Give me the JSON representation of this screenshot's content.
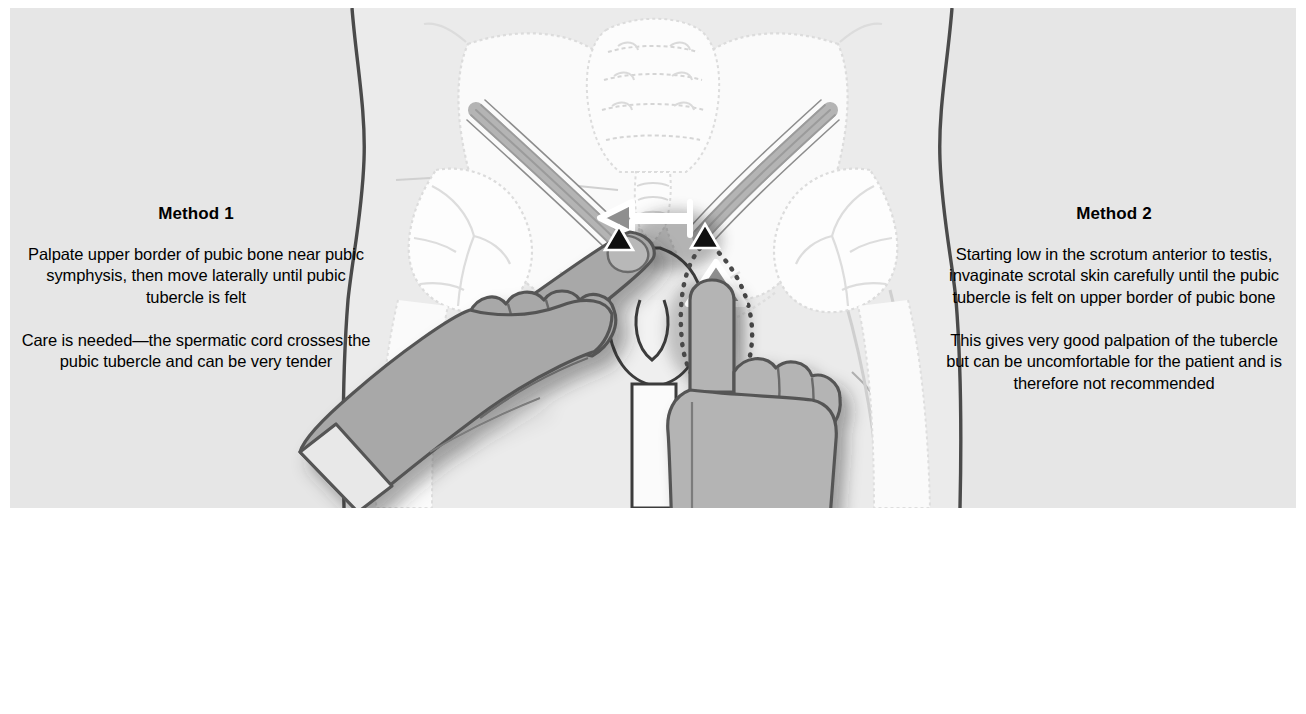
{
  "figure": {
    "type": "medical-illustration",
    "background_color": "#e6e6e6",
    "page_color": "#ffffff"
  },
  "panels": {
    "left": {
      "title": "Method 1",
      "paragraphs": [
        "Palpate upper border of pubic bone near pubic symphysis, then move laterally until pubic tubercle is felt",
        "Care is needed—the spermatic cord crosses the pubic tubercle and can be very tender"
      ]
    },
    "right": {
      "title": "Method 2",
      "paragraphs": [
        "Starting low in the scrotum anterior to testis, invaginate scrotal skin carefully until the pubic tubercle is felt on upper border of pubic bone",
        "This gives very good palpation of the tubercle but can be uncomfortable for the patient and is therefore not recommended"
      ]
    }
  },
  "markers": {
    "left_tubercle_label": "pubic-tubercle-marker-left",
    "right_tubercle_label": "pubic-tubercle-marker-right",
    "marker_color": "#101010"
  },
  "arrows": {
    "lateral_arrow": {
      "name": "lateral-movement-arrow",
      "direction": "left",
      "fill": "#8f8f8f",
      "outline": "#ffffff"
    },
    "invagination_arrow": {
      "name": "invagination-arrow",
      "direction": "up",
      "fill": "#8f8f8f",
      "outline": "#ffffff"
    },
    "dotted_path": {
      "name": "invaginated-scrotal-skin-path",
      "style": "dotted",
      "color": "#4a4a4a"
    }
  },
  "anatomy": {
    "torso_outline_color": "#4a4a4a",
    "bone_color": "#fbfbfb",
    "bone_outline_color": "#d8d8d8",
    "spermatic_cord_color": "#9a9a9a",
    "parts": [
      "iliac-crest-left",
      "iliac-crest-right",
      "sacrum",
      "coccyx",
      "hip-joint-left",
      "hip-joint-right",
      "femur-left",
      "femur-right",
      "pubic-symphysis",
      "spermatic-cord-left",
      "spermatic-cord-right",
      "scrotum",
      "penis"
    ]
  },
  "hands": {
    "left": {
      "name": "examining-hand-method-1",
      "glove_color": "#a8a8a8",
      "cuff_color": "#e8e8e8",
      "outline_color": "#555555",
      "posture": "index-finger-extended-diagonally"
    },
    "right": {
      "name": "examining-hand-method-2",
      "glove_color": "#b4b4b4",
      "cuff_color": "#f4f4f4",
      "outline_color": "#555555",
      "posture": "index-finger-extended-upward"
    }
  }
}
